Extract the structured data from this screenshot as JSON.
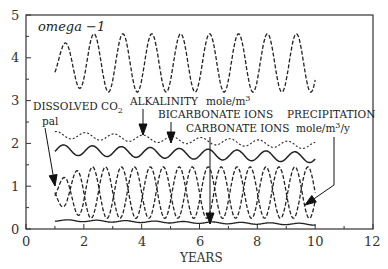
{
  "chart_data": {
    "type": "line",
    "xlabel": "YEARS",
    "ylabel": "",
    "xlim": [
      0,
      12
    ],
    "ylim": [
      0,
      5
    ],
    "x_ticks": [
      "0",
      "2",
      "4",
      "6",
      "8",
      "10",
      "12"
    ],
    "y_ticks": [
      "0",
      "1",
      "2",
      "3",
      "4",
      "5"
    ],
    "grid": false,
    "legend": "inline annotations",
    "series": [
      {
        "name": "omega - 1",
        "style": "dashed",
        "x_range": [
          1,
          10
        ],
        "mean": 3.9,
        "amplitude": 0.68,
        "period_years": 1,
        "note": "first cycle smaller: peak ~4.1, trough ~3.0; later peaks ~4.55, troughs ~3.2"
      },
      {
        "name": "ALKALINITY mole/m3",
        "style": "dotted",
        "x_range": [
          1,
          10
        ],
        "start": 2.2,
        "end": 1.95,
        "amplitude": 0.1
      },
      {
        "name": "BICARBONATE IONS",
        "style": "solid",
        "x_range": [
          1,
          10
        ],
        "start": 1.8,
        "end": 1.65,
        "amplitude": 0.12
      },
      {
        "name": "DISSOLVED CO2 pal",
        "style": "dashed",
        "x_range": [
          1,
          10
        ],
        "mean": 0.85,
        "amplitude": 0.6,
        "period_years": 1
      },
      {
        "name": "CARBONATE IONS",
        "style": "dashed",
        "x_range": [
          1,
          10
        ],
        "mean": 0.85,
        "amplitude": 0.6,
        "period_years": 1,
        "phase": "opposite to dissolved CO2"
      },
      {
        "name": "PRECIPITATION mole/m3/y",
        "style": "solid",
        "x_range": [
          1,
          10
        ],
        "start": 0.2,
        "end": 0.1,
        "amplitude": 0.02
      }
    ],
    "annotations": [
      "DISSOLVED CO2",
      "pal",
      "ALKALINITY",
      "mole/m3",
      "BICARBONATE IONS",
      "CARBONATE IONS",
      "PRECIPITATION",
      "mole/m3/y"
    ]
  },
  "labels": {
    "title": "omega −1",
    "dissolved": "DISSOLVED CO",
    "dissolved_sub": "2",
    "pal": "pal",
    "alkalinity": "ALKALINITY",
    "mole_m3": "mole/m",
    "mole_m3_sup": "3",
    "bicarbonate": "BICARBONATE IONS",
    "carbonate": "CARBONATE IONS",
    "precipitation": "PRECIPITATION",
    "mole_m3y_a": "mole/m",
    "mole_m3y_sup": "3",
    "mole_m3y_b": "/y",
    "xlabel": "YEARS"
  },
  "axes": {
    "x": [
      "0",
      "2",
      "4",
      "6",
      "8",
      "10",
      "12"
    ],
    "y": [
      "0",
      "1",
      "2",
      "3",
      "4",
      "5"
    ]
  }
}
